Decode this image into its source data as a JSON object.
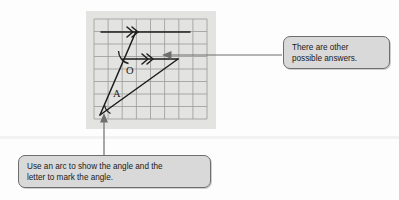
{
  "page": {
    "background_color": "#fdfdfd"
  },
  "figure": {
    "name": "grid-diagram",
    "panel_color": "#e3e3e1",
    "grid_line_color": "#9a9a98",
    "stroke_color": "#1c1c1c",
    "columns": 8,
    "rows": 8,
    "labels": [
      {
        "text": "O",
        "x": 130,
        "y": 70
      },
      {
        "text": "A",
        "x": 117,
        "y": 94
      }
    ],
    "arrow_marks": [
      {
        "name": "double-chevron-top",
        "x": 131,
        "y": 32
      },
      {
        "name": "double-chevron-middle",
        "x": 146,
        "y": 59
      }
    ],
    "arcs": [
      {
        "name": "angle-arc-o",
        "vertex_label": "O"
      },
      {
        "name": "angle-arc-a",
        "vertex_label": "A"
      }
    ]
  },
  "callouts": {
    "answers": {
      "name": "callout-other-answers",
      "line1": "There are other",
      "line2": "possible answers.",
      "fill": "#d9d9d9",
      "border": "#6e6e6e"
    },
    "arc": {
      "name": "callout-use-arc",
      "line1": "Use an arc to show the angle and the",
      "line2": "letter to mark the angle.",
      "fill": "#d9d9d9",
      "border": "#6e6e6e"
    }
  },
  "connectors": [
    {
      "name": "connector-answers",
      "from": "callout-other-answers",
      "to": "middle-parallel-line",
      "direction": "left"
    },
    {
      "name": "connector-arc",
      "from": "callout-use-arc",
      "to": "angle-vertex-a",
      "direction": "up"
    }
  ]
}
